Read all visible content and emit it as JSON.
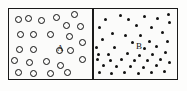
{
  "figure": {
    "background_color": "#fdfdfc",
    "border_color": "#1a1a1a",
    "particle_color": "#111111"
  },
  "compartments": [
    {
      "id": "A",
      "label": "A",
      "label_x": 48,
      "label_y": 35,
      "particle_style": "open-circle",
      "particle_count": 24,
      "particle_size": 7,
      "description": "left compartment with open circles"
    },
    {
      "id": "B",
      "label": "B",
      "label_x": 43,
      "label_y": 33,
      "particle_style": "filled-dot",
      "particle_count": 46,
      "particle_size": 3.4,
      "description": "right compartment with filled dots"
    }
  ],
  "particles_A": [
    {
      "x": 6,
      "y": 7
    },
    {
      "x": 16,
      "y": 6
    },
    {
      "x": 29,
      "y": 8
    },
    {
      "x": 44,
      "y": 5
    },
    {
      "x": 62,
      "y": 2
    },
    {
      "x": 54,
      "y": 13
    },
    {
      "x": 68,
      "y": 14
    },
    {
      "x": 8,
      "y": 22
    },
    {
      "x": 21,
      "y": 22
    },
    {
      "x": 38,
      "y": 22
    },
    {
      "x": 57,
      "y": 24
    },
    {
      "x": 7,
      "y": 37
    },
    {
      "x": 21,
      "y": 37
    },
    {
      "x": 47,
      "y": 38
    },
    {
      "x": 58,
      "y": 38
    },
    {
      "x": 70,
      "y": 30
    },
    {
      "x": 2,
      "y": 48
    },
    {
      "x": 17,
      "y": 50
    },
    {
      "x": 34,
      "y": 49
    },
    {
      "x": 48,
      "y": 53
    },
    {
      "x": 70,
      "y": 47
    },
    {
      "x": 6,
      "y": 60
    },
    {
      "x": 21,
      "y": 61
    },
    {
      "x": 38,
      "y": 61
    },
    {
      "x": 55,
      "y": 60
    }
  ],
  "particles_B": [
    {
      "x": 11,
      "y": 9
    },
    {
      "x": 26,
      "y": 5
    },
    {
      "x": 34,
      "y": 9
    },
    {
      "x": 50,
      "y": 6
    },
    {
      "x": 63,
      "y": 8
    },
    {
      "x": 74,
      "y": 4
    },
    {
      "x": 75,
      "y": 12
    },
    {
      "x": 5,
      "y": 17
    },
    {
      "x": 42,
      "y": 15
    },
    {
      "x": 57,
      "y": 17
    },
    {
      "x": 18,
      "y": 23
    },
    {
      "x": 31,
      "y": 25
    },
    {
      "x": 46,
      "y": 25
    },
    {
      "x": 68,
      "y": 22
    },
    {
      "x": 8,
      "y": 29
    },
    {
      "x": 38,
      "y": 32
    },
    {
      "x": 55,
      "y": 31
    },
    {
      "x": 73,
      "y": 31
    },
    {
      "x": 2,
      "y": 37
    },
    {
      "x": 20,
      "y": 37
    },
    {
      "x": 50,
      "y": 38
    },
    {
      "x": 62,
      "y": 36
    },
    {
      "x": 4,
      "y": 44
    },
    {
      "x": 14,
      "y": 44
    },
    {
      "x": 33,
      "y": 43
    },
    {
      "x": 45,
      "y": 45
    },
    {
      "x": 58,
      "y": 44
    },
    {
      "x": 71,
      "y": 42
    },
    {
      "x": 3,
      "y": 49
    },
    {
      "x": 16,
      "y": 50
    },
    {
      "x": 27,
      "y": 49
    },
    {
      "x": 40,
      "y": 50
    },
    {
      "x": 53,
      "y": 50
    },
    {
      "x": 66,
      "y": 49
    },
    {
      "x": 75,
      "y": 52
    },
    {
      "x": 9,
      "y": 55
    },
    {
      "x": 22,
      "y": 56
    },
    {
      "x": 36,
      "y": 56
    },
    {
      "x": 49,
      "y": 57
    },
    {
      "x": 62,
      "y": 55
    },
    {
      "x": 5,
      "y": 62
    },
    {
      "x": 17,
      "y": 63
    },
    {
      "x": 30,
      "y": 62
    },
    {
      "x": 44,
      "y": 63
    },
    {
      "x": 57,
      "y": 62
    },
    {
      "x": 70,
      "y": 61
    }
  ]
}
